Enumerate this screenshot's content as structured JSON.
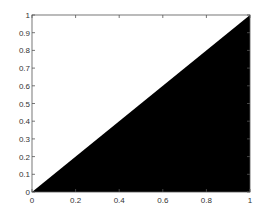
{
  "chart_data": {
    "type": "area",
    "title": "",
    "xlabel": "",
    "ylabel": "",
    "xlim": [
      0,
      1
    ],
    "ylim": [
      0,
      1
    ],
    "grid": false,
    "legend": null,
    "series": [
      {
        "name": "y = x (filled below)",
        "x": [
          0,
          1
        ],
        "y": [
          0,
          1
        ],
        "fill": "#000000"
      }
    ],
    "xticks": [
      0,
      0.2,
      0.4,
      0.6,
      0.8,
      1
    ],
    "xtick_labels": [
      "0",
      "0.2",
      "0.4",
      "0.6",
      "0.8",
      "1"
    ],
    "yticks": [
      0,
      0.1,
      0.2,
      0.3,
      0.4,
      0.5,
      0.6,
      0.7,
      0.8,
      0.9,
      1
    ],
    "ytick_labels": [
      "0",
      "0.1",
      "0.2",
      "0.3",
      "0.4",
      "0.5",
      "0.6",
      "0.7",
      "0.8",
      "0.9",
      "1"
    ]
  },
  "style": {
    "fill_color": "#000000",
    "axis_color": "#555555",
    "background": "#ffffff"
  }
}
